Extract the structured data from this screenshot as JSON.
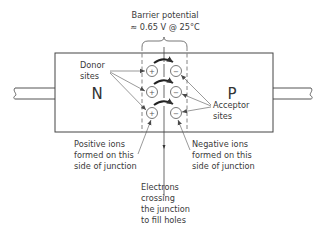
{
  "diagram": {
    "barrier_label_line1": "Barrier potential",
    "barrier_label_line2": "≈ 0.65 V @ 25°C",
    "n_region_label": "N",
    "p_region_label": "P",
    "donor_label": [
      "Donor",
      "sites"
    ],
    "acceptor_label": [
      "Acceptor",
      "sites"
    ],
    "positive_ions_label": [
      "Positive ions",
      "formed on this",
      "side of junction"
    ],
    "negative_ions_label": [
      "Negative ions",
      "formed on this",
      "side of junction"
    ],
    "electrons_label": [
      "Electrons",
      "crossing",
      "the junction",
      "to fill holes"
    ],
    "positive_ion_symbol": "+",
    "negative_ion_symbol": "−",
    "ion_rows": 3,
    "colors": {
      "line": "#4a4a4a",
      "text": "#3a3a3a",
      "background": "#ffffff"
    }
  }
}
